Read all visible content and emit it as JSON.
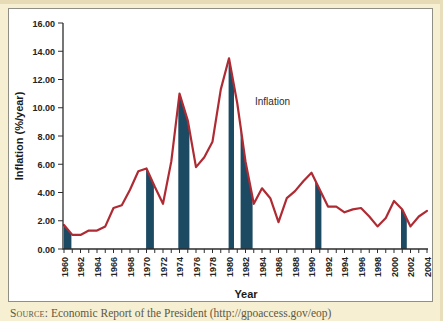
{
  "page": {
    "background_color": "#F6EFD2",
    "edge_strip_color": "#E6DBB4"
  },
  "panel": {
    "background_color": "#FFFFFF",
    "border_color": "#8F8F85"
  },
  "source": {
    "label": "Source:",
    "text": " Economic Report of the President (http://gpoaccess.gov/eop)"
  },
  "chart_data": {
    "type": "line",
    "title": "",
    "xlabel": "Year",
    "ylabel": "Inflation (%/year)",
    "annotation": {
      "text": "Inflation",
      "x": 1983.2,
      "y": 10.4
    },
    "x_range": [
      1960,
      2004
    ],
    "ylim": [
      0,
      16
    ],
    "grid": false,
    "legend_position": "none",
    "y_tick_labels": [
      "0.00",
      "2.00",
      "4.00",
      "6.00",
      "8.00",
      "10.00",
      "12.00",
      "14.00",
      "16.00"
    ],
    "x_tick_labels": [
      1960,
      1962,
      1964,
      1966,
      1968,
      1970,
      1972,
      1974,
      1976,
      1978,
      1980,
      1982,
      1984,
      1986,
      1988,
      1990,
      1992,
      1994,
      1996,
      1998,
      2000,
      2002,
      2004
    ],
    "x_minor_tick_every": 1,
    "years": [
      1960,
      1961,
      1962,
      1963,
      1964,
      1965,
      1966,
      1967,
      1968,
      1969,
      1970,
      1971,
      1972,
      1973,
      1974,
      1975,
      1976,
      1977,
      1978,
      1979,
      1980,
      1981,
      1982,
      1983,
      1984,
      1985,
      1986,
      1987,
      1988,
      1989,
      1990,
      1991,
      1992,
      1993,
      1994,
      1995,
      1996,
      1997,
      1998,
      1999,
      2000,
      2001,
      2002,
      2003,
      2004
    ],
    "values": [
      1.7,
      1.0,
      1.0,
      1.3,
      1.3,
      1.6,
      2.9,
      3.1,
      4.2,
      5.5,
      5.7,
      4.4,
      3.2,
      6.2,
      11.0,
      9.1,
      5.8,
      6.5,
      7.6,
      11.3,
      13.5,
      10.3,
      6.2,
      3.2,
      4.3,
      3.6,
      1.9,
      3.6,
      4.1,
      4.8,
      5.4,
      4.2,
      3.0,
      3.0,
      2.6,
      2.8,
      2.9,
      2.3,
      1.6,
      2.2,
      3.4,
      2.8,
      1.6,
      2.3,
      2.7
    ],
    "recession_bars": [
      [
        1960.0,
        1960.9
      ],
      [
        1969.95,
        1970.9
      ],
      [
        1973.85,
        1975.2
      ],
      [
        1979.95,
        1980.6
      ],
      [
        1981.4,
        1982.85
      ],
      [
        1990.45,
        1991.2
      ],
      [
        2000.85,
        2001.55
      ]
    ],
    "colors": {
      "line": "#AF2B33",
      "bar": "#1C4A63",
      "axis": "#2D2D2D",
      "tick_text": "#222222"
    }
  }
}
